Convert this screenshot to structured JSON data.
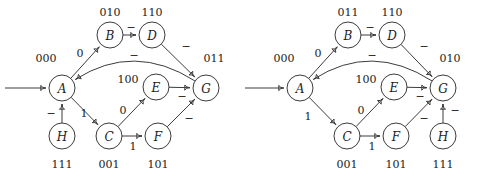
{
  "figure": {
    "stroke_color": "#3c3c3c",
    "text_color": "#1d1d1d",
    "background": "#ffffff"
  },
  "diagrams": [
    {
      "id": "left-diagram",
      "name": "left-state-diagram",
      "origin": {
        "x": 0,
        "y": 0
      },
      "start_arrow": {
        "x1": 5,
        "y1": 88,
        "x2": 44,
        "y2": 88
      },
      "nodes": [
        {
          "id": "A",
          "label": "A",
          "code": "000",
          "cx": 62,
          "cy": 88,
          "r": 13,
          "code_x": 46,
          "code_y": 62
        },
        {
          "id": "B",
          "label": "B",
          "code": "010",
          "cx": 110,
          "cy": 35,
          "r": 13,
          "code_x": 110,
          "code_y": 16
        },
        {
          "id": "D",
          "label": "D",
          "code": "110",
          "cx": 152,
          "cy": 35,
          "r": 13,
          "code_x": 152,
          "code_y": 16
        },
        {
          "id": "E",
          "label": "E",
          "code": "100",
          "cx": 156,
          "cy": 87,
          "r": 13,
          "code_x": 128,
          "code_y": 83
        },
        {
          "id": "G",
          "label": "G",
          "code": "011",
          "cx": 206,
          "cy": 88,
          "r": 13,
          "code_x": 214,
          "code_y": 62
        },
        {
          "id": "C",
          "label": "C",
          "code": "001",
          "cx": 109,
          "cy": 136,
          "r": 13,
          "code_x": 109,
          "code_y": 168
        },
        {
          "id": "F",
          "label": "F",
          "code": "101",
          "cx": 158,
          "cy": 136,
          "r": 13,
          "code_x": 158,
          "code_y": 168
        },
        {
          "id": "H",
          "label": "H",
          "code": "111",
          "cx": 62,
          "cy": 136,
          "r": 13,
          "code_x": 62,
          "code_y": 168
        }
      ],
      "edges": [
        {
          "from": "A",
          "to": "B",
          "label": "0",
          "lx": 80,
          "ly": 57,
          "curve": "straight"
        },
        {
          "from": "B",
          "to": "D",
          "label": "−",
          "lx": 131,
          "ly": 31,
          "curve": "straight"
        },
        {
          "from": "D",
          "to": "G",
          "label": "−",
          "lx": 186,
          "ly": 50,
          "curve": "straight"
        },
        {
          "from": "G",
          "to": "A",
          "label": "−",
          "lx": 134,
          "ly": 59,
          "curve": "arc-top"
        },
        {
          "from": "A",
          "to": "C",
          "label": "1",
          "lx": 84,
          "ly": 117,
          "curve": "straight"
        },
        {
          "from": "C",
          "to": "E",
          "label": "0",
          "lx": 123,
          "ly": 114,
          "curve": "straight"
        },
        {
          "from": "C",
          "to": "F",
          "label": "1",
          "lx": 133,
          "ly": 150,
          "curve": "straight"
        },
        {
          "from": "E",
          "to": "G",
          "label": "−",
          "lx": 182,
          "ly": 100,
          "curve": "straight"
        },
        {
          "from": "F",
          "to": "G",
          "label": "−",
          "lx": 189,
          "ly": 122,
          "curve": "straight"
        },
        {
          "from": "H",
          "to": "A",
          "label": "−",
          "lx": 51,
          "ly": 117,
          "curve": "straight"
        }
      ]
    },
    {
      "id": "right-diagram",
      "name": "right-state-diagram",
      "origin": {
        "x": 240,
        "y": 0
      },
      "start_arrow": {
        "x1": 245,
        "y1": 88,
        "x2": 282,
        "y2": 88
      },
      "nodes": [
        {
          "id": "A",
          "label": "A",
          "code": "000",
          "cx": 300,
          "cy": 88,
          "r": 13,
          "code_x": 284,
          "code_y": 62
        },
        {
          "id": "B",
          "label": "B",
          "code": "011",
          "cx": 348,
          "cy": 35,
          "r": 13,
          "code_x": 348,
          "code_y": 16
        },
        {
          "id": "D",
          "label": "D",
          "code": "110",
          "cx": 392,
          "cy": 35,
          "r": 13,
          "code_x": 392,
          "code_y": 16
        },
        {
          "id": "E",
          "label": "E",
          "code": "100",
          "cx": 394,
          "cy": 87,
          "r": 13,
          "code_x": 366,
          "code_y": 83
        },
        {
          "id": "G",
          "label": "G",
          "code": "010",
          "cx": 443,
          "cy": 88,
          "r": 13,
          "code_x": 450,
          "code_y": 62
        },
        {
          "id": "C",
          "label": "C",
          "code": "001",
          "cx": 347,
          "cy": 136,
          "r": 13,
          "code_x": 347,
          "code_y": 168
        },
        {
          "id": "F",
          "label": "F",
          "code": "101",
          "cx": 396,
          "cy": 136,
          "r": 13,
          "code_x": 396,
          "code_y": 168
        },
        {
          "id": "H",
          "label": "H",
          "code": "111",
          "cx": 443,
          "cy": 136,
          "r": 13,
          "code_x": 443,
          "code_y": 168
        }
      ],
      "edges": [
        {
          "from": "A",
          "to": "B",
          "label": "0",
          "lx": 318,
          "ly": 57,
          "curve": "straight"
        },
        {
          "from": "B",
          "to": "D",
          "label": "−",
          "lx": 370,
          "ly": 31,
          "curve": "straight"
        },
        {
          "from": "D",
          "to": "G",
          "label": "−",
          "lx": 424,
          "ly": 50,
          "curve": "straight"
        },
        {
          "from": "G",
          "to": "A",
          "label": "−",
          "lx": 372,
          "ly": 59,
          "curve": "arc-top"
        },
        {
          "from": "A",
          "to": "C",
          "label": "1",
          "lx": 308,
          "ly": 120,
          "curve": "straight"
        },
        {
          "from": "C",
          "to": "E",
          "label": "0",
          "lx": 361,
          "ly": 114,
          "curve": "straight"
        },
        {
          "from": "C",
          "to": "F",
          "label": "1",
          "lx": 372,
          "ly": 150,
          "curve": "straight"
        },
        {
          "from": "E",
          "to": "G",
          "label": "−",
          "lx": 420,
          "ly": 100,
          "curve": "straight"
        },
        {
          "from": "F",
          "to": "G",
          "label": "−",
          "lx": 424,
          "ly": 122,
          "curve": "straight"
        },
        {
          "from": "H",
          "to": "G",
          "label": "−",
          "lx": 455,
          "ly": 114,
          "curve": "straight"
        }
      ]
    }
  ]
}
